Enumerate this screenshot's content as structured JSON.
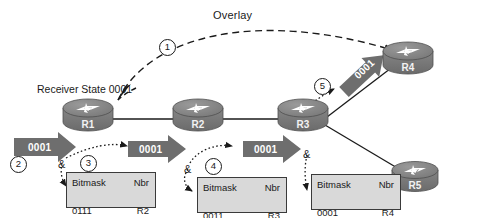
{
  "figure": {
    "type": "network-diagram",
    "title_label": "Overlay",
    "receiver_state_label": "Receiver State 0001"
  },
  "routers": [
    {
      "id": "r1",
      "label": "R1",
      "x": 88,
      "y": 101
    },
    {
      "id": "r2",
      "label": "R2",
      "x": 198,
      "y": 101
    },
    {
      "id": "r3",
      "label": "R3",
      "x": 303,
      "y": 101
    },
    {
      "id": "r4",
      "label": "R4",
      "x": 408,
      "y": 44
    },
    {
      "id": "r5",
      "label": "R5",
      "x": 415,
      "y": 163
    }
  ],
  "flow_arrows": [
    {
      "id": "a1",
      "label": "0001",
      "from": "ingress",
      "to": "R1"
    },
    {
      "id": "a2",
      "label": "0001",
      "from": "R1",
      "to": "R2"
    },
    {
      "id": "a3",
      "label": "0001",
      "from": "R2",
      "to": "R3"
    },
    {
      "id": "a4",
      "label": "0001",
      "from": "R3",
      "to": "R4"
    }
  ],
  "steps": [
    {
      "n": "1",
      "glyph": "①",
      "text": "1"
    },
    {
      "n": "2",
      "glyph": "②",
      "text": "2"
    },
    {
      "n": "3",
      "glyph": "③",
      "text": "3"
    },
    {
      "n": "4",
      "glyph": "④",
      "text": "4"
    },
    {
      "n": "5",
      "glyph": "⑤",
      "text": "5"
    }
  ],
  "and_operators": [
    {
      "id": "amp1",
      "symbol": "&"
    },
    {
      "id": "amp2",
      "symbol": "&"
    },
    {
      "id": "amp3",
      "symbol": "&"
    }
  ],
  "tables": [
    {
      "id": "tbl-r1",
      "headers": [
        "Bitmask",
        "Nbr"
      ],
      "rows": [
        [
          "0111",
          "R2"
        ]
      ]
    },
    {
      "id": "tbl-r2",
      "headers": [
        "Bitmask",
        "Nbr"
      ],
      "rows": [
        [
          "0011",
          "R3"
        ]
      ]
    },
    {
      "id": "tbl-r3",
      "headers": [
        "Bitmask",
        "Nbr"
      ],
      "rows": [
        [
          "0001",
          "R4"
        ]
      ]
    }
  ],
  "colors": {
    "arrow_fill": "#6e6e6e",
    "router_body": "#7a7a7a",
    "router_top": "#8c8c8c",
    "table_fill": "#d9d9d9",
    "table_border": "#3a3a3a",
    "line": "#1a1a1a",
    "text": "#1a1a1a",
    "arrow_text": "#ffffff"
  }
}
